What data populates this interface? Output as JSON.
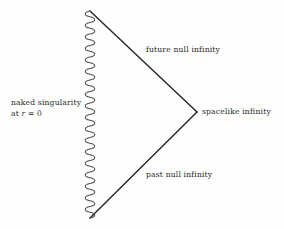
{
  "figure": {
    "kind": "penrose-conformal-diagram",
    "width": 284,
    "height": 229,
    "background_color": "#fefefe",
    "line_color": "#272727",
    "squiggle_color": "#555555"
  },
  "labels": {
    "singularity_line1": "naked singularity",
    "singularity_line2_prefix": "at ",
    "singularity_line2_var": "r",
    "singularity_line2_suffix": " = 0",
    "future_null_infinity": "future null infinity",
    "spacelike_infinity": "spacelike infinity",
    "past_null_infinity": "past null infinity"
  },
  "geometry": {
    "top_vertex": {
      "x": 90,
      "y": 11
    },
    "bottom_vertex": {
      "x": 90,
      "y": 218
    },
    "right_vertex": {
      "x": 197,
      "y": 112
    },
    "squiggle_amplitude": 4.6,
    "squiggle_wavelength": 11.5,
    "line_width": 1.35
  }
}
